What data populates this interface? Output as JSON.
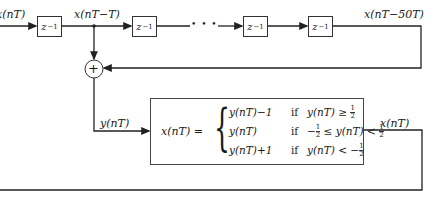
{
  "diagram": {
    "type": "block-diagram",
    "input_label": "x(nT)",
    "tap_label": "x(nT−T)",
    "delay_output_label": "x(nT−50T)",
    "sum_output_label": "y(nT)",
    "quantizer_output_label": "x(nT)",
    "ellipsis": "• • •",
    "adder_symbol": "+",
    "delays": [
      {
        "label": "z",
        "exp": "−1"
      },
      {
        "label": "z",
        "exp": "−1"
      },
      {
        "label": "z",
        "exp": "−1"
      },
      {
        "label": "z",
        "exp": "−1"
      }
    ],
    "quantizer": {
      "lhs": "x(nT) =",
      "cases": [
        {
          "value": "y(nT)−1",
          "if": "if",
          "cond_pre": "y(nT) ≥ ",
          "num": "1",
          "den": "2",
          "cond_mid": "",
          "num2": "",
          "den2": ""
        },
        {
          "value": "y(nT)",
          "if": "if",
          "cond_pre": "−",
          "num": "1",
          "den": "2",
          "cond_mid": " ≤ y(nT) < ",
          "num2": "1",
          "den2": "2"
        },
        {
          "value": "y(nT)+1",
          "if": "if",
          "cond_pre": "y(nT) < −",
          "num": "1",
          "den": "2",
          "cond_mid": "",
          "num2": "",
          "den2": ""
        }
      ]
    }
  }
}
